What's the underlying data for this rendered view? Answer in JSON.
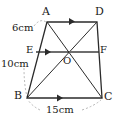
{
  "figure": {
    "type": "geometry-diagram",
    "shape": "trapezoid",
    "vertices": {
      "A": "A",
      "B": "B",
      "C": "C",
      "D": "D"
    },
    "points": {
      "E": "E",
      "F": "F",
      "O": "O"
    },
    "dimensions": {
      "side_ae": "6cm",
      "side_eb": "10cm",
      "side_bc": "15cm"
    },
    "colors": {
      "stroke": "#2b2b2b",
      "midline": "#6e6e6e",
      "leader": "#9a9a9a",
      "text": "#1a1a1a"
    }
  }
}
